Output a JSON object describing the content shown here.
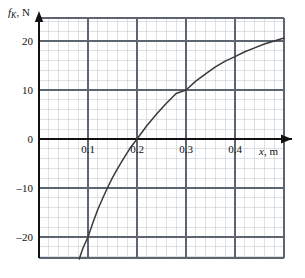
{
  "figure": {
    "title": "",
    "y_axis_label_var": "f",
    "y_axis_label_sub": "K",
    "y_axis_label_unit": ", N",
    "x_axis_label_var": "x",
    "x_axis_label_unit": ", m",
    "arrow_x_name": "x-axis-arrow",
    "arrow_y_name": "y-axis-arrow"
  },
  "chart_data": {
    "type": "line",
    "title": "",
    "xlabel": "x, m",
    "ylabel": "f_K, N",
    "xlim": [
      0.0,
      0.5
    ],
    "ylim": [
      -24,
      24
    ],
    "grid": true,
    "minor_grid": true,
    "legend": "none",
    "x_ticks": [
      0.1,
      0.2,
      0.3,
      0.4
    ],
    "x_tick_labels": [
      "0.1",
      "0.2",
      "0.3",
      "0.4"
    ],
    "y_ticks": [
      20,
      10,
      0,
      -10,
      -20
    ],
    "y_tick_labels": [
      "20",
      "10",
      "0",
      "–10",
      "–20"
    ],
    "x_major_step": 0.1,
    "y_major_step": 10,
    "x_minor_step": 0.02,
    "y_minor_step": 2,
    "series": [
      {
        "name": "f_K(x)",
        "color": "#3a3a3a",
        "x": [
          0.082,
          0.09,
          0.1,
          0.11,
          0.12,
          0.13,
          0.14,
          0.15,
          0.16,
          0.17,
          0.185,
          0.2,
          0.22,
          0.24,
          0.26,
          0.28,
          0.3,
          0.32,
          0.34,
          0.36,
          0.38,
          0.4,
          0.42,
          0.44,
          0.46,
          0.48,
          0.5
        ],
        "y": [
          -24.5,
          -22.2,
          -20.0,
          -17.1,
          -14.4,
          -12.1,
          -9.9,
          -7.9,
          -6.1,
          -4.4,
          -2.0,
          0.0,
          2.7,
          5.1,
          7.3,
          9.3,
          10.0,
          11.8,
          13.3,
          14.7,
          15.9,
          16.8,
          17.8,
          18.6,
          19.4,
          20.0,
          20.6
        ]
      }
    ],
    "annotations": [
      {
        "label": "zero-crossing",
        "x": 0.185,
        "y": 0
      },
      {
        "label": "passes-through",
        "x": 0.1,
        "y": -20
      },
      {
        "label": "passes-through",
        "x": 0.3,
        "y": 10
      }
    ]
  },
  "ticks": {
    "x_labels": [
      "0.1",
      "0.2",
      "0.3",
      "0.4"
    ],
    "y_labels": [
      "20",
      "10",
      "0",
      "–10",
      "–20"
    ]
  }
}
